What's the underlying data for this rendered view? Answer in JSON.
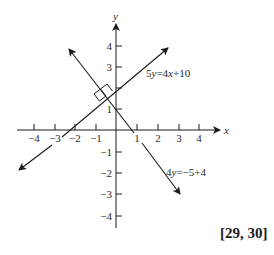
{
  "diagram": {
    "axes": {
      "x_label": "x",
      "y_label": "y",
      "x_ticks": [
        "−4",
        "−3",
        "−2",
        "−1",
        "1",
        "2",
        "3",
        "4"
      ],
      "y_ticks": [
        "4",
        "3",
        "2",
        "1",
        "−1",
        "−2",
        "−3",
        "−4"
      ],
      "y_tick_labels_shown": [
        "4",
        "3",
        "1",
        "−1",
        "−2",
        "−3",
        "−4"
      ]
    },
    "lines": [
      {
        "label_prefix": "5",
        "label_var": "y",
        "label_mid": "=4",
        "label_var2": "x",
        "label_suffix": "+10",
        "slope": 0.8,
        "intercept": 2
      },
      {
        "label_prefix": "4",
        "label_var": "y",
        "label_mid": "=−5+4",
        "slope": -1.25,
        "intercept": 1
      }
    ],
    "right_angle_marker": true,
    "reference": "[29, 30]"
  },
  "colors": {
    "ink": "#1a1a1a",
    "background": "#ffffff"
  }
}
